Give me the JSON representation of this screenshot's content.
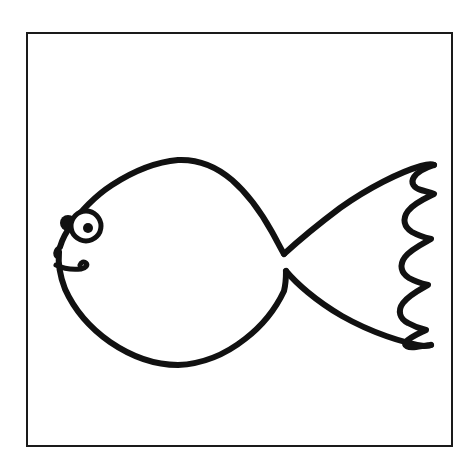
{
  "page": {
    "background_color": "#ffffff",
    "width": 476,
    "height": 471
  },
  "artwork": {
    "name": "fish-line-drawing",
    "description": "Black outline coloring-book style drawing of a cartoon fish facing left, inside a thin rectangular frame",
    "style": "hand-drawn black ink outline on white, no fill",
    "stroke_color": "#111111",
    "fill_color": "none",
    "stroke_width_body": 6,
    "stroke_width_frame": 2
  },
  "frame": {
    "name": "border-rectangle",
    "color": "#1a1a1a",
    "x": 27,
    "y": 33,
    "width": 425,
    "height": 413,
    "stroke_width": 2
  },
  "fish": {
    "orientation": "facing-left",
    "parts": [
      {
        "name": "body-top-outline",
        "label": "Upper body and head curve"
      },
      {
        "name": "body-bottom-outline",
        "label": "Lower body and belly curve"
      },
      {
        "name": "mouth",
        "label": "Mouth hook curve"
      },
      {
        "name": "eye-outline",
        "label": "Eye circle"
      },
      {
        "name": "eye-pupil",
        "label": "Eye pupil"
      },
      {
        "name": "eye-blob",
        "label": "Small dark blob beside eye"
      },
      {
        "name": "tail-top-edge",
        "label": "Upper tail fin edge"
      },
      {
        "name": "tail-bottom-edge",
        "label": "Lower tail fin edge"
      },
      {
        "name": "tail-scalloped-edge",
        "label": "Wavy scalloped trailing edge of tail"
      }
    ],
    "eye": {
      "center_x": 86,
      "center_y": 226,
      "radius": 15,
      "pupil_radius": 5,
      "pupil_center_x": 88,
      "pupil_center_y": 228,
      "blob_center_x": 68,
      "blob_center_y": 223,
      "blob_radius": 8
    },
    "tail": {
      "scallop_count": 5,
      "notch_upper_x": 283,
      "notch_upper_y": 254,
      "notch_lower_x": 286,
      "notch_lower_y": 271,
      "tip_top_x": 434,
      "tip_top_y": 165,
      "tip_bottom_x": 430,
      "tip_bottom_y": 345
    }
  },
  "paths": {
    "body_top": "M 60,247 C 62,240 66,232 72,224 C 80,212 95,196 112,185 C 132,172 155,162 178,160 C 200,159 218,168 232,180 C 248,194 262,214 272,232 C 277,241 281,249 284,254",
    "body_bottom": "M 59,252 C 58,262 60,276 65,289 C 74,309 90,328 110,342 C 132,357 156,365 178,365 C 202,364 226,354 245,339 C 262,326 276,308 284,291 C 286,283 286,275 286,271",
    "head_tip": "M 60,247 C 56,250 55,252 56,255 C 57,258 58,252 59,252",
    "mouth": "M 56,265 C 62,268 72,270 81,269 C 86,268 88,265 86,263 C 84,261 81,262 80,265",
    "tail_top": "M 284,254 C 296,243 316,226 340,208 C 368,188 400,172 421,166 C 428,164 432,164 434,165",
    "tail_bottom": "M 286,271 C 296,283 316,301 342,316 C 372,333 404,343 424,346 C 428,346 430,346 431,345",
    "tail_scallop": "M 434,165 C 428,167 418,171 414,177 C 410,183 414,188 421,190 C 428,192 432,193 434,194 C 428,197 414,203 408,211 C 402,219 404,227 412,232 C 419,236 427,238 431,239 C 424,243 411,249 405,257 C 399,265 401,273 409,278 C 416,282 424,284 428,285 C 421,289 409,295 403,303 C 397,311 400,319 408,323 C 415,327 422,329 426,330 C 420,333 410,337 406,342 C 403,346 408,348 416,347 C 423,346 428,345 431,345"
  },
  "colors": {
    "ink": "#111111",
    "paper": "#ffffff",
    "frame": "#1a1a1a"
  }
}
